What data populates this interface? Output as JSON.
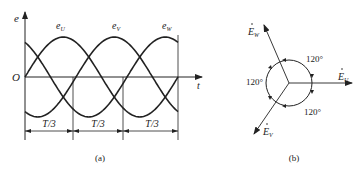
{
  "figure_a": {
    "caption": "(a)",
    "y_axis_label": "e",
    "x_axis_label": "t",
    "origin_label": "O",
    "curves": [
      {
        "name": "e",
        "sub": "U",
        "phase_deg": 0
      },
      {
        "name": "e",
        "sub": "V",
        "phase_deg": -120
      },
      {
        "name": "e",
        "sub": "W",
        "phase_deg": 120
      }
    ],
    "intervals": [
      "T/3",
      "T/3",
      "T/3"
    ]
  },
  "figure_b": {
    "caption": "(b)",
    "phasors": [
      {
        "name": "E",
        "sub": "U",
        "angle_deg": 0
      },
      {
        "name": "E",
        "sub": "V",
        "angle_deg": -120
      },
      {
        "name": "E",
        "sub": "W",
        "angle_deg": 120
      }
    ],
    "angles": [
      "120°",
      "120°",
      "120°"
    ]
  },
  "colors": {
    "line": "#222222"
  }
}
